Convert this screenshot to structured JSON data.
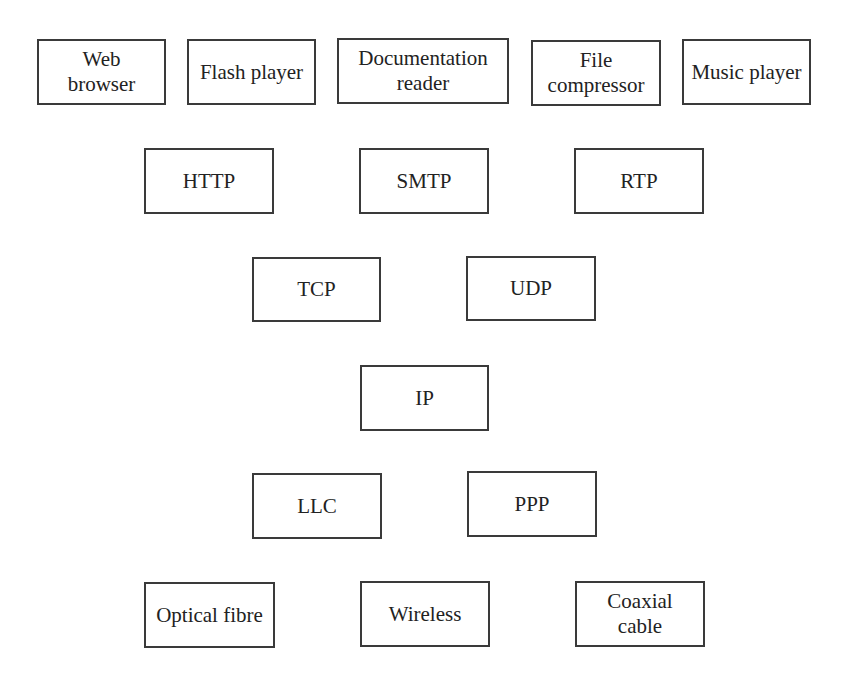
{
  "diagram": {
    "layers": [
      {
        "name": "applications",
        "nodes": [
          {
            "label": "Web\nbrowser",
            "x": 37,
            "y": 39,
            "w": 129,
            "h": 66
          },
          {
            "label": "Flash player",
            "x": 187,
            "y": 39,
            "w": 129,
            "h": 66
          },
          {
            "label": "Documentation\nreader",
            "x": 337,
            "y": 38,
            "w": 172,
            "h": 66
          },
          {
            "label": "File\ncompressor",
            "x": 531,
            "y": 40,
            "w": 130,
            "h": 66
          },
          {
            "label": "Music player",
            "x": 682,
            "y": 39,
            "w": 129,
            "h": 66
          }
        ]
      },
      {
        "name": "application-protocols",
        "nodes": [
          {
            "label": "HTTP",
            "x": 144,
            "y": 148,
            "w": 130,
            "h": 66
          },
          {
            "label": "SMTP",
            "x": 359,
            "y": 148,
            "w": 130,
            "h": 66
          },
          {
            "label": "RTP",
            "x": 574,
            "y": 148,
            "w": 130,
            "h": 66
          }
        ]
      },
      {
        "name": "transport",
        "nodes": [
          {
            "label": "TCP",
            "x": 252,
            "y": 257,
            "w": 129,
            "h": 65
          },
          {
            "label": "UDP",
            "x": 466,
            "y": 256,
            "w": 130,
            "h": 65
          }
        ]
      },
      {
        "name": "network",
        "nodes": [
          {
            "label": "IP",
            "x": 360,
            "y": 365,
            "w": 129,
            "h": 66
          }
        ]
      },
      {
        "name": "link",
        "nodes": [
          {
            "label": "LLC",
            "x": 252,
            "y": 473,
            "w": 130,
            "h": 66
          },
          {
            "label": "PPP",
            "x": 467,
            "y": 471,
            "w": 130,
            "h": 66
          }
        ]
      },
      {
        "name": "physical",
        "nodes": [
          {
            "label": "Optical fibre",
            "x": 144,
            "y": 582,
            "w": 131,
            "h": 66
          },
          {
            "label": "Wireless",
            "x": 360,
            "y": 581,
            "w": 130,
            "h": 66
          },
          {
            "label": "Coaxial\ncable",
            "x": 575,
            "y": 581,
            "w": 130,
            "h": 66
          }
        ]
      }
    ]
  }
}
